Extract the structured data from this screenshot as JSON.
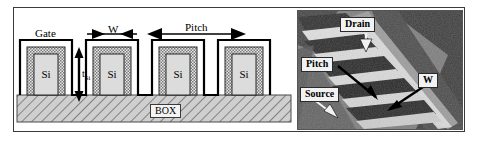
{
  "figure": {
    "panels": [
      "schematic",
      "sem-micrograph"
    ]
  },
  "schematic": {
    "labels": {
      "gate": "Gate",
      "width": "W",
      "pitch": "Pitch",
      "fin_thickness": "t",
      "fin_thickness_sub": "Si",
      "buried_oxide": "BOX"
    },
    "fins": [
      {
        "label": "Si"
      },
      {
        "label": "Si"
      },
      {
        "label": "Si"
      },
      {
        "label": "Si"
      }
    ],
    "colors": {
      "gate_line": "#000000",
      "fin_fill": "#d8d8d8",
      "oxide_hatch": "#9a9a9a",
      "box_fill": "#c9c9c9",
      "frame": "#3a3a3a"
    }
  },
  "sem": {
    "labels": {
      "drain": "Drain",
      "pitch": "Pitch",
      "source": "Source",
      "width": "W"
    },
    "colors": {
      "dark": "#5a5a5a",
      "darker": "#2e2e2e",
      "bright": "#e8e8e8",
      "label_bg": "#f2f2f2"
    }
  }
}
